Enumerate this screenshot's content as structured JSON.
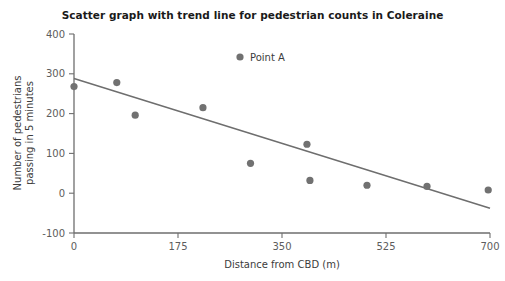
{
  "chart_data": {
    "type": "scatter",
    "title": "Scatter graph with trend line for pedestrian counts in Coleraine",
    "xlabel": "Distance from CBD (m)",
    "ylabel_line1": "Number of pedestrians",
    "ylabel_line2": "passing in 5 minutes",
    "xlim": [
      0,
      700
    ],
    "ylim": [
      -100,
      400
    ],
    "xticks": [
      0,
      175,
      350,
      525,
      700
    ],
    "xtick_labels": [
      "0",
      "175",
      "350",
      "525",
      "700"
    ],
    "yticks": [
      -100,
      0,
      100,
      200,
      300,
      400
    ],
    "ytick_labels": [
      "-100",
      "0",
      "100",
      "200",
      "300",
      "400"
    ],
    "grid": false,
    "legend_position": "top-center",
    "legend": [
      {
        "name": "Point A",
        "marker": "circle",
        "color": "#717171"
      }
    ],
    "series": [
      {
        "name": "Point A",
        "type": "scatter",
        "color": "#717171",
        "points": [
          {
            "x": 0,
            "y": 268
          },
          {
            "x": 72,
            "y": 278
          },
          {
            "x": 103,
            "y": 196
          },
          {
            "x": 217,
            "y": 215
          },
          {
            "x": 297,
            "y": 75
          },
          {
            "x": 392,
            "y": 123
          },
          {
            "x": 397,
            "y": 32
          },
          {
            "x": 493,
            "y": 20
          },
          {
            "x": 594,
            "y": 17
          },
          {
            "x": 697,
            "y": 8
          }
        ]
      },
      {
        "name": "Trend line",
        "type": "line",
        "color": "#6e6e6e",
        "points": [
          {
            "x": 0,
            "y": 288
          },
          {
            "x": 700,
            "y": -38
          }
        ]
      }
    ]
  }
}
